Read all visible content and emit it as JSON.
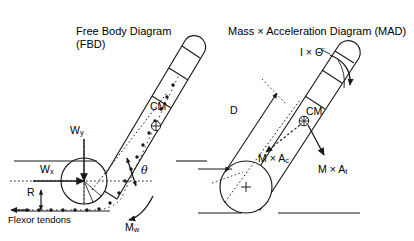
{
  "figure": {
    "background_color": "#ffffff",
    "stroke_color": "#1a1a1a",
    "width": 414,
    "height": 241
  },
  "panels": {
    "left": {
      "title_line1": "Free Body Diagram",
      "title_line2": "(FBD)",
      "labels": {
        "cm": "CM",
        "w_y": "W",
        "w_y_sub": "y",
        "w_x": "W",
        "w_x_sub": "x",
        "r": "R",
        "theta": "θ",
        "flexor_tendons": "Flexor tendons",
        "m_w": "M",
        "m_w_sub": "w"
      }
    },
    "right": {
      "title": "Mass × Acceleration Diagram (MAD)",
      "labels": {
        "inertia": "I × Θ̈",
        "distance": "D",
        "cm": "CM",
        "m_ac": "M × A",
        "m_ac_sub": "c",
        "m_at": "M × A",
        "m_at_sub": "t"
      }
    }
  }
}
